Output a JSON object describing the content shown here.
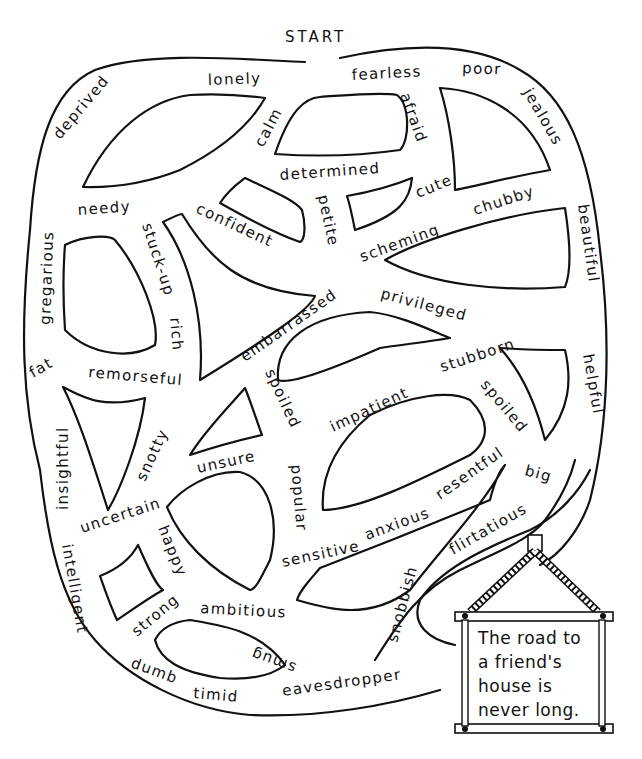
{
  "title": "START",
  "sign": {
    "lines": [
      "The road to",
      "a friend's",
      "house is",
      "never long."
    ]
  },
  "words": [
    {
      "id": "deprived",
      "text": "deprived"
    },
    {
      "id": "lonely",
      "text": "lonely"
    },
    {
      "id": "calm",
      "text": "calm"
    },
    {
      "id": "fearless",
      "text": "fearless"
    },
    {
      "id": "afraid",
      "text": "afraid"
    },
    {
      "id": "poor",
      "text": "poor"
    },
    {
      "id": "jealous",
      "text": "jealous"
    },
    {
      "id": "determined",
      "text": "determined"
    },
    {
      "id": "cute",
      "text": "cute"
    },
    {
      "id": "petite",
      "text": "petite"
    },
    {
      "id": "needy",
      "text": "needy"
    },
    {
      "id": "confident",
      "text": "confident"
    },
    {
      "id": "scheming",
      "text": "scheming"
    },
    {
      "id": "chubby",
      "text": "chubby"
    },
    {
      "id": "beautiful",
      "text": "beautiful"
    },
    {
      "id": "gregarious",
      "text": "gregarious"
    },
    {
      "id": "stuck-up",
      "text": "stuck-up"
    },
    {
      "id": "rich",
      "text": "rich"
    },
    {
      "id": "embarrassed",
      "text": "embarrassed"
    },
    {
      "id": "privileged",
      "text": "privileged"
    },
    {
      "id": "fat",
      "text": "fat"
    },
    {
      "id": "remorseful",
      "text": "remorseful"
    },
    {
      "id": "stubborn",
      "text": "stubborn"
    },
    {
      "id": "helpful",
      "text": "helpful"
    },
    {
      "id": "spoiled-1",
      "text": "spoiled"
    },
    {
      "id": "impatient",
      "text": "impatient"
    },
    {
      "id": "spoiled-2",
      "text": "spoiled"
    },
    {
      "id": "insightful",
      "text": "insightful"
    },
    {
      "id": "snotty",
      "text": "snotty"
    },
    {
      "id": "unsure",
      "text": "unsure"
    },
    {
      "id": "popular",
      "text": "popular"
    },
    {
      "id": "resentful",
      "text": "resentful"
    },
    {
      "id": "big",
      "text": "big"
    },
    {
      "id": "uncertain",
      "text": "uncertain"
    },
    {
      "id": "anxious",
      "text": "anxious"
    },
    {
      "id": "flirtatious",
      "text": "flirtatious"
    },
    {
      "id": "sensitive",
      "text": "sensitive"
    },
    {
      "id": "happy",
      "text": "happy"
    },
    {
      "id": "intelligent",
      "text": "intelligent"
    },
    {
      "id": "strong",
      "text": "strong"
    },
    {
      "id": "ambitious",
      "text": "ambitious"
    },
    {
      "id": "smug",
      "text": "smug"
    },
    {
      "id": "snobbish",
      "text": "snobbish"
    },
    {
      "id": "dumb",
      "text": "dumb"
    },
    {
      "id": "timid",
      "text": "timid"
    },
    {
      "id": "eavesdropper",
      "text": "eavesdropper"
    }
  ]
}
